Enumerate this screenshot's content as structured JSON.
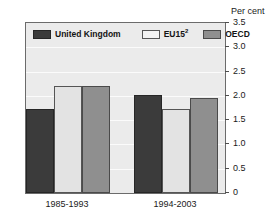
{
  "chart_data": {
    "type": "bar",
    "title": "",
    "subtitle": "",
    "xlabel": "",
    "ylabel": "Per cent",
    "unit_caption": "Per cent",
    "categories": [
      "1985-1993",
      "1994-2003"
    ],
    "series": [
      {
        "name": "United Kingdom",
        "key": "uk",
        "color": "#3b3b3b",
        "values": [
          1.73,
          2.02
        ]
      },
      {
        "name": "EU15",
        "key": "eu15",
        "color": "#e3e3e3",
        "values": [
          2.2,
          1.73
        ],
        "footnote": "2"
      },
      {
        "name": "OECD",
        "key": "oecd",
        "color": "#8f8f8f",
        "values": [
          2.2,
          1.95
        ]
      }
    ],
    "ylim": [
      0,
      3.5
    ],
    "yticks": [
      "0",
      "0.5",
      "1.0",
      "1.5",
      "2.0",
      "2.5",
      "3.0",
      "3.5"
    ],
    "ytick_values": [
      0,
      0.5,
      1.0,
      1.5,
      2.0,
      2.5,
      3.0,
      3.5
    ],
    "grid": true,
    "grid_color": "#fbfbfb",
    "plot_background": "#ebebeb",
    "legend_position": "top-left-inside",
    "legend": [
      {
        "label": "United Kingdom",
        "footnote": "",
        "color": "#3b3b3b"
      },
      {
        "label": "EU15",
        "footnote": "2",
        "color": "#e3e3e3"
      },
      {
        "label": "OECD",
        "footnote": "",
        "color": "#8f8f8f"
      }
    ]
  }
}
